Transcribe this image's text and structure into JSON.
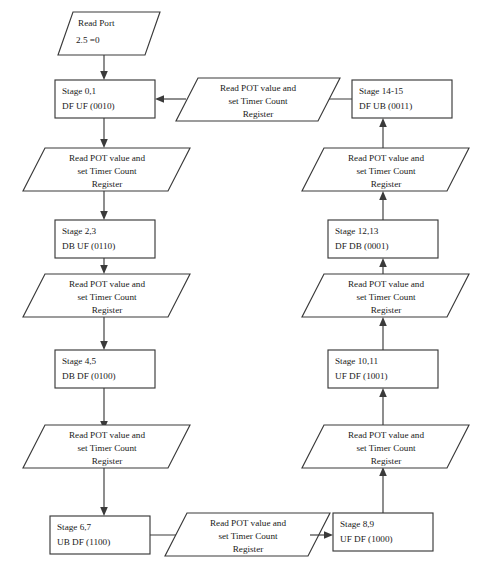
{
  "diagram": {
    "stroke_color": "#3a3a3a",
    "text_color": "#1a1a1a",
    "background_color": "#ffffff",
    "io_label": {
      "line1": "Read POT value and",
      "line2": "set Timer Count",
      "line3": "Register"
    },
    "start": {
      "line1": "Read Port",
      "line2": "2.5 =0"
    },
    "stages": {
      "s01": {
        "line1": "Stage 0,1",
        "line2": "DF UF (0010)"
      },
      "s23": {
        "line1": "Stage 2,3",
        "line2": "DB UF (0110)"
      },
      "s45": {
        "line1": "Stage 4,5",
        "line2": "DB DF (0100)"
      },
      "s67": {
        "line1": "Stage 6,7",
        "line2": "UB DF (1100)"
      },
      "s89": {
        "line1": "Stage 8,9",
        "line2": "UF DF (1000)"
      },
      "s1011": {
        "line1": "Stage 10,11",
        "line2": "UF DF (1001)"
      },
      "s1213": {
        "line1": "Stage 12,13",
        "line2": "DF DB (0001)"
      },
      "s1415": {
        "line1": "Stage 14-15",
        "line2": "DF UB (0011)"
      }
    }
  }
}
